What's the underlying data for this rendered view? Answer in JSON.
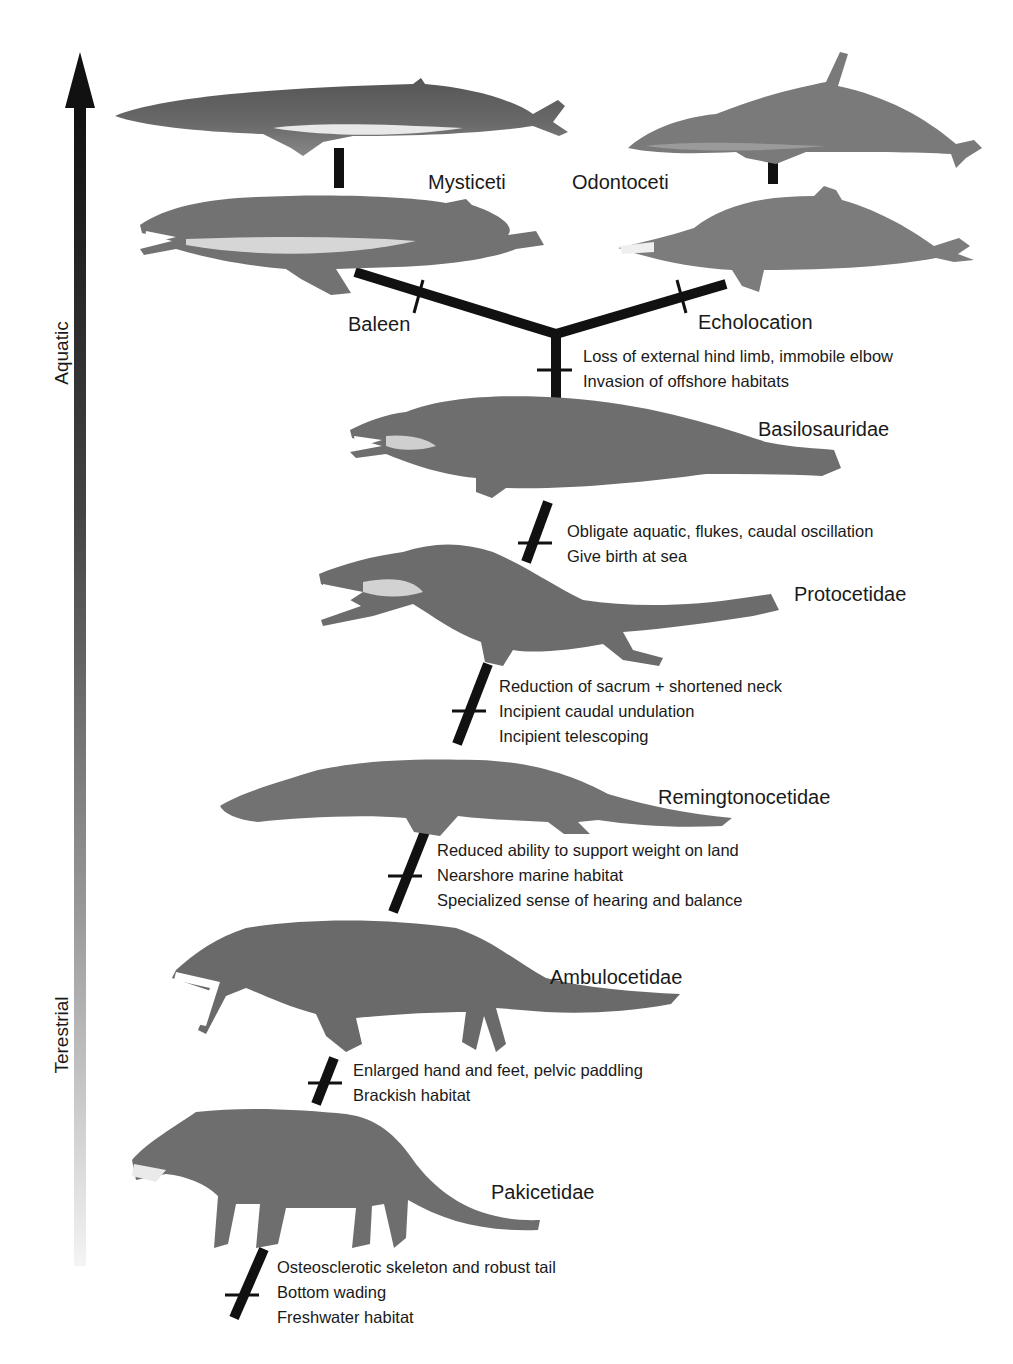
{
  "axis": {
    "top_label": "Aquatic",
    "bottom_label": "Terestrial",
    "arrow_color_top": "#111111",
    "arrow_color_bottom": "#f2f2f2"
  },
  "clades": {
    "left": "Mysticeti",
    "right": "Odontoceti"
  },
  "branch_traits": {
    "left": "Baleen",
    "right": "Echolocation"
  },
  "nodes": [
    {
      "family": "Basilosauridae",
      "traits": [
        "Loss of external hind limb, immobile elbow",
        "Invasion of offshore habitats"
      ]
    },
    {
      "family": "Protocetidae",
      "traits": [
        "Obligate aquatic, flukes, caudal oscillation",
        "Give birth at sea"
      ]
    },
    {
      "family": "Remingtonocetidae",
      "traits": [
        "Reduction of sacrum + shortened neck",
        "Incipient caudal undulation",
        "Incipient telescoping"
      ]
    },
    {
      "family": "Ambulocetidae",
      "traits": [
        "Reduced ability to support weight on land",
        "Nearshore marine habitat",
        "Specialized sense of hearing and balance"
      ]
    },
    {
      "family": "Pakicetidae",
      "traits": [
        "Enlarged hand and feet, pelvic paddling",
        "Brackish habitat"
      ]
    },
    {
      "family": "",
      "traits": [
        "Osteosclerotic skeleton and robust tail",
        "Bottom wading",
        "Freshwater habitat"
      ]
    }
  ],
  "colors": {
    "line": "#111111",
    "animal_dark": "#4a4a4a",
    "animal_mid": "#6e6e6e",
    "animal_light": "#bdbdbd",
    "belly": "#e6e6e6"
  }
}
